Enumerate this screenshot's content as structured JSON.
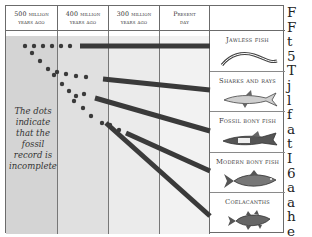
{
  "diagram": {
    "columns": [
      {
        "label_line1": "500 million",
        "label_line2": "years ago"
      },
      {
        "label_line1": "400 million",
        "label_line2": "years ago"
      },
      {
        "label_line1": "300 million",
        "label_line2": "years ago"
      },
      {
        "label_line1": "Present",
        "label_line2": "day"
      }
    ],
    "note": "The dots indicate that the fossil record is incomplete",
    "groups": [
      {
        "label": "Jawless fish",
        "icon": "lamprey-illustration"
      },
      {
        "label": "Sharks and rays",
        "icon": "shark-illustration"
      },
      {
        "label": "Fossil bony fish",
        "icon": "fossil-fish-illustration"
      },
      {
        "label": "Modern bony fish",
        "icon": "bony-fish-illustration"
      },
      {
        "label": "Coelacanths",
        "icon": "coelacanth-illustration"
      }
    ],
    "colors": {
      "line": "#3a3a3a",
      "shade_dark": "#d6d6d6",
      "shade_light": "#e6e6e6",
      "border": "#6b6b6b"
    }
  },
  "side_text": {
    "letters": [
      "F",
      "F",
      "t",
      "5",
      "T",
      "j",
      "l",
      "f",
      "a",
      "t",
      "I",
      "6",
      "a",
      "a",
      "h",
      "e",
      "o"
    ]
  }
}
